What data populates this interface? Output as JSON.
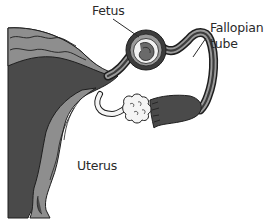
{
  "diagram": {
    "labels": {
      "fetus": "Fetus",
      "fallopian_tube_line1": "Fallopian",
      "fallopian_tube_line2": "tube",
      "uterus": "Uterus"
    },
    "colors": {
      "background": "#ffffff",
      "uterus_dark": "#4a4a4a",
      "uterus_light": "#8e8e8e",
      "outline": "#1e1e1e",
      "tube_dark": "#3c3c3c",
      "tube_light": "#9a9a9a",
      "ovary": "#f4f4f4",
      "label_text": "#2a2a2a"
    }
  }
}
